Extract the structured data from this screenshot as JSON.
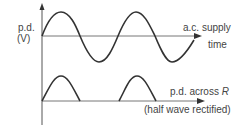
{
  "diagram": {
    "y_axis_label_line1": "p.d.",
    "y_axis_label_line2": "(V)",
    "top_trace_label": "a.c. supply",
    "time_axis_label": "time",
    "bottom_trace_label_prefix": "p.d. across ",
    "bottom_trace_label_var": "R",
    "bottom_trace_note": "(half wave rectified)",
    "colors": {
      "line": "#333333",
      "axis": "#444444",
      "background": "#ffffff"
    }
  }
}
